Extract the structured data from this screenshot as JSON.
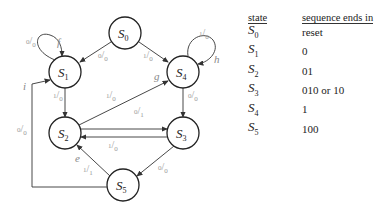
{
  "diagram": {
    "states": [
      {
        "id": "S0",
        "name": "S",
        "sub": "0",
        "cx": 125,
        "cy": 33
      },
      {
        "id": "S1",
        "name": "S",
        "sub": "1",
        "cx": 65,
        "cy": 72
      },
      {
        "id": "S4",
        "name": "S",
        "sub": "4",
        "cx": 183,
        "cy": 72
      },
      {
        "id": "S2",
        "name": "S",
        "sub": "2",
        "cx": 65,
        "cy": 133
      },
      {
        "id": "S3",
        "name": "S",
        "sub": "3",
        "cx": 183,
        "cy": 133
      },
      {
        "id": "S5",
        "name": "S",
        "sub": "5",
        "cx": 123,
        "cy": 185
      }
    ],
    "transitions": [
      {
        "from": "S0",
        "to": "S1",
        "label": "0/0"
      },
      {
        "from": "S0",
        "to": "S4",
        "label": "1/0"
      },
      {
        "from": "S1",
        "to": "S1",
        "label": "0/0",
        "annotation": "f"
      },
      {
        "from": "S4",
        "to": "S4",
        "label": "1/0",
        "annotation": "h"
      },
      {
        "from": "S1",
        "to": "S2",
        "label": "1/0"
      },
      {
        "from": "S2",
        "to": "S4",
        "label": "1/0",
        "annotation": "g"
      },
      {
        "from": "S4",
        "to": "S3",
        "label": "0/0"
      },
      {
        "from": "S2",
        "to": "S3",
        "label": "0/1"
      },
      {
        "from": "S3",
        "to": "S2",
        "label": "1/0"
      },
      {
        "from": "S3",
        "to": "S5",
        "label": "0/0"
      },
      {
        "from": "S5",
        "to": "S2",
        "label": "1/1",
        "annotation": "e"
      },
      {
        "from": "S5",
        "to": "S1",
        "label": "0/0",
        "annotation": "i"
      }
    ]
  },
  "table": {
    "headers": [
      "state",
      "sequence ends in"
    ],
    "rows": [
      {
        "state": "S",
        "sub": "0",
        "seq": "reset"
      },
      {
        "state": "S",
        "sub": "1",
        "seq": "0"
      },
      {
        "state": "S",
        "sub": "2",
        "seq": "01"
      },
      {
        "state": "S",
        "sub": "3",
        "seq": "010 or 10"
      },
      {
        "state": "S",
        "sub": "4",
        "seq": "1"
      },
      {
        "state": "S",
        "sub": "5",
        "seq": "100"
      }
    ]
  },
  "labels": {
    "s0_s1": {
      "n": "0",
      "d": "0"
    },
    "s0_s4": {
      "n": "1",
      "d": "0"
    },
    "s1_loop": {
      "n": "0",
      "d": "0"
    },
    "s4_loop": {
      "n": "1",
      "d": "0"
    },
    "s1_s2": {
      "n": "1",
      "d": "0"
    },
    "s2_s4": {
      "n": "1",
      "d": "0"
    },
    "s4_s3": {
      "n": "0",
      "d": "0"
    },
    "s2_s3": {
      "n": "0",
      "d": "1"
    },
    "s3_s2": {
      "n": "1",
      "d": "0"
    },
    "s3_s5": {
      "n": "0",
      "d": "0"
    },
    "s5_s2": {
      "n": "1",
      "d": "1"
    },
    "s5_s1": {
      "n": "0",
      "d": "0"
    },
    "ann_f": "f",
    "ann_g": "g",
    "ann_h": "h",
    "ann_e": "e",
    "ann_i": "i"
  }
}
